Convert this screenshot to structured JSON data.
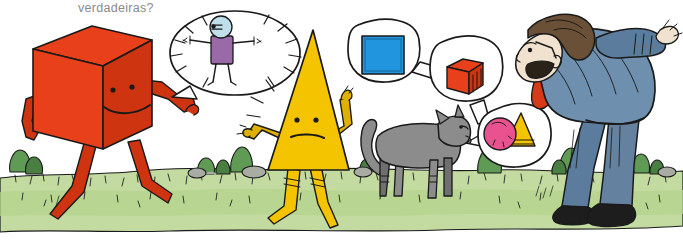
{
  "page": {
    "caption": "verdadeiras?",
    "caption_color": "#8a8a8a",
    "background_color": "#ffffff",
    "width": 683,
    "height": 240
  },
  "palette": {
    "ink": "#1a1a1a",
    "cube_red": "#e8401a",
    "cube_red_shade": "#cf3410",
    "cube_red_dark": "#b82c0c",
    "cone_yellow": "#f5c400",
    "cone_yellow_shade": "#e0b000",
    "grass_light": "#c3dba0",
    "grass_mid": "#b4d48c",
    "bush_green": "#5f9b55",
    "bush_green_dark": "#4a7f42",
    "rock_gray": "#a8aca3",
    "cat_gray": "#8c8c8c",
    "cat_gray_dark": "#6f6f6f",
    "suit_blue": "#6f8fae",
    "suit_blue_shade": "#5b7c9c",
    "trouser_blue": "#64819f",
    "tie_red": "#d63a16",
    "hair_brown": "#6b5038",
    "skin": "#f0e2cf",
    "shoe_black": "#1d1d1d",
    "bubble_white": "#ffffff",
    "stick_shirt_purple": "#9a6aa8",
    "stick_head_blue": "#bfe0ea",
    "square_blue": "#2196de",
    "square_blue_shade": "#1a7cbd",
    "ball_pink": "#e8528f",
    "ball_pink_shade": "#d13b79"
  },
  "scene": {
    "title": "cartoon-shape-characters-scene",
    "ground": {
      "label": "grassy-ground"
    },
    "characters": [
      {
        "id": "red-cube",
        "label": "red cube character walking",
        "color": "#e8401a",
        "face": "dot eyes and smile",
        "pose": "walking left-to-right, right arm raised pointing at speech bubble"
      },
      {
        "id": "yellow-cone",
        "label": "yellow cone character",
        "color": "#f5c400",
        "face": "dot eyes and neutral wavy mouth",
        "pose": "standing, hands on hips, two legs with shoes"
      },
      {
        "id": "gray-cat",
        "label": "gray cat standing facing right",
        "color": "#8c8c8c"
      },
      {
        "id": "bending-man",
        "label": "man in blue suit with red tie bending forward",
        "suit_color": "#6f8fae",
        "tie_color": "#d63a16",
        "hair_color": "#6b5038"
      }
    ],
    "bubbles": [
      {
        "id": "bubble-stick-figure",
        "owner": "red-cube",
        "type": "speech-bubble",
        "contents": "stick figure person with purple shirt and light blue head, radiating motion lines"
      },
      {
        "id": "bubble-blue-square",
        "owner": "yellow-cone",
        "type": "thought-bubble",
        "contents": "blue square"
      },
      {
        "id": "bubble-red-cube",
        "owner": "chain",
        "type": "thought-bubble",
        "contents": "red cube"
      },
      {
        "id": "bubble-ball-cone",
        "owner": "gray-cat",
        "type": "thought-bubble",
        "contents": "pink ball and yellow cone"
      }
    ]
  }
}
